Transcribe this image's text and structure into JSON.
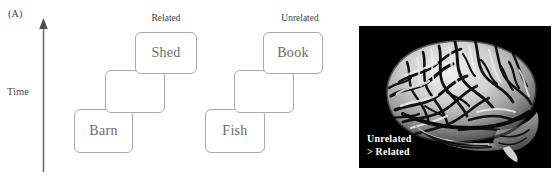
{
  "figure": {
    "panels": [
      {
        "letter": "(A)",
        "name": "paradigm-diagram"
      },
      {
        "letter": "(B)",
        "name": "brain-activation-image"
      }
    ]
  },
  "panel_a": {
    "letter": "(A)",
    "axis_label": "Time",
    "axis_direction": "up",
    "groups": [
      {
        "caption": "Related",
        "cards": [
          {
            "label": "Shed",
            "position": "top"
          },
          {
            "label": "",
            "position": "middle"
          },
          {
            "label": "Barn",
            "position": "bottom"
          }
        ]
      },
      {
        "caption": "Unrelated",
        "cards": [
          {
            "label": "Book",
            "position": "top"
          },
          {
            "label": "",
            "position": "middle"
          },
          {
            "label": "Fish",
            "position": "bottom"
          }
        ]
      }
    ]
  },
  "panel_b": {
    "letter": "(B)",
    "image_name": "lateral-brain-surface-render",
    "background_color": "#000000",
    "overlay_caption_line1": "Unrelated",
    "overlay_caption_line2": "> Related",
    "overlay_text_color": "#ffffff"
  }
}
